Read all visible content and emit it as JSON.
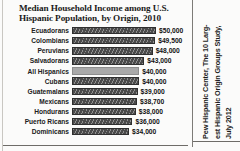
{
  "figure": {
    "title": "Median Household Income among U.S. Hispanic Population, by Origin, 2010",
    "source_credit": "Pew Hispanic Center, The 10 Larg-\nest Hispanic Origin Groups Study,\nJuly 2012"
  },
  "chart_data": {
    "type": "bar",
    "orientation": "horizontal",
    "title": "Median Household Income among U.S. Hispanic Population, by Origin, 2010",
    "xlabel": "",
    "ylabel": "",
    "xlim": [
      0,
      50000
    ],
    "grid": false,
    "legend": null,
    "categories": [
      "Ecuadorans",
      "Colombians",
      "Peruvians",
      "Salvadorans",
      "All Hispanics",
      "Cubans",
      "Guatemalans",
      "Mexicans",
      "Hondurans",
      "Puerto Ricans",
      "Dominicans"
    ],
    "values": [
      50000,
      49500,
      48000,
      43000,
      40000,
      40000,
      39000,
      38700,
      38000,
      36000,
      34000
    ],
    "value_labels": [
      "$50,000",
      "$49,500",
      "$48,000",
      "$43,000",
      "$40,000",
      "$40,000",
      "$39,000",
      "$38,700",
      "$38,000",
      "$36,000",
      "$34,000"
    ],
    "highlight_index": 4,
    "bar_color": "#4a4a4a",
    "highlight_color": "#a9a9a9"
  }
}
